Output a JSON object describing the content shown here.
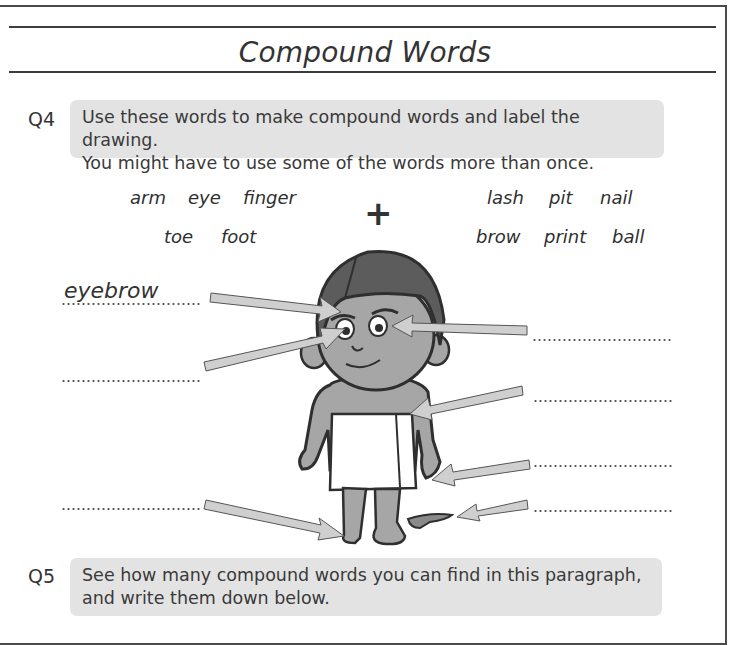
{
  "header": {
    "title": "Compound Words"
  },
  "q4": {
    "number": "Q4",
    "instruction_line1": "Use these words to make compound words and label the drawing.",
    "instruction_line2": "You might have to use some of the words more than once.",
    "left_words": [
      "arm",
      "eye",
      "finger",
      "toe",
      "foot"
    ],
    "plus": "+",
    "right_words": [
      "lash",
      "pit",
      "nail",
      "brow",
      "print",
      "ball"
    ],
    "labels": [
      {
        "side": "left",
        "value": "eyebrow"
      },
      {
        "side": "left",
        "value": ""
      },
      {
        "side": "left",
        "value": ""
      },
      {
        "side": "right",
        "value": ""
      },
      {
        "side": "right",
        "value": ""
      },
      {
        "side": "right",
        "value": ""
      },
      {
        "side": "right",
        "value": ""
      }
    ]
  },
  "q5": {
    "number": "Q5",
    "instruction_line1": "See how many compound words you can find in this paragraph,",
    "instruction_line2": "and write them down below."
  },
  "colors": {
    "box_bg": "#e3e3e3",
    "skin": "#a6a6a6",
    "hair": "#5c5c5c",
    "arrow": "#cfcfcf"
  }
}
